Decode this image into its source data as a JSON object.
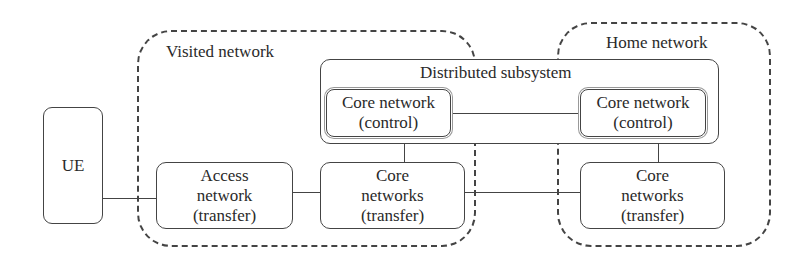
{
  "diagram": {
    "regions": {
      "visited": {
        "label": "Visited network"
      },
      "home": {
        "label": "Home network"
      }
    },
    "subsystem": {
      "label": "Distributed subsystem"
    },
    "nodes": {
      "ue": {
        "label": "UE"
      },
      "access": {
        "label": "Access\nnetwork\n(transfer)"
      },
      "core_control_visited": {
        "label": "Core network\n(control)"
      },
      "core_control_home": {
        "label": "Core network\n(control)"
      },
      "core_transfer_visited": {
        "label": "Core\nnetworks\n(transfer)"
      },
      "core_transfer_home": {
        "label": "Core\nnetworks\n(transfer)"
      }
    },
    "edges": [
      {
        "from": "UE",
        "to": "Access network (transfer)"
      },
      {
        "from": "Access network (transfer)",
        "to": "Core networks (transfer) [visited]"
      },
      {
        "from": "Core networks (transfer) [visited]",
        "to": "Core networks (transfer) [home]"
      },
      {
        "from": "Core network (control) [visited]",
        "to": "Core network (control) [home]"
      },
      {
        "from": "Distributed subsystem",
        "to": "Core networks (transfer) [visited]"
      },
      {
        "from": "Distributed subsystem",
        "to": "Core networks (transfer) [home]"
      }
    ]
  }
}
